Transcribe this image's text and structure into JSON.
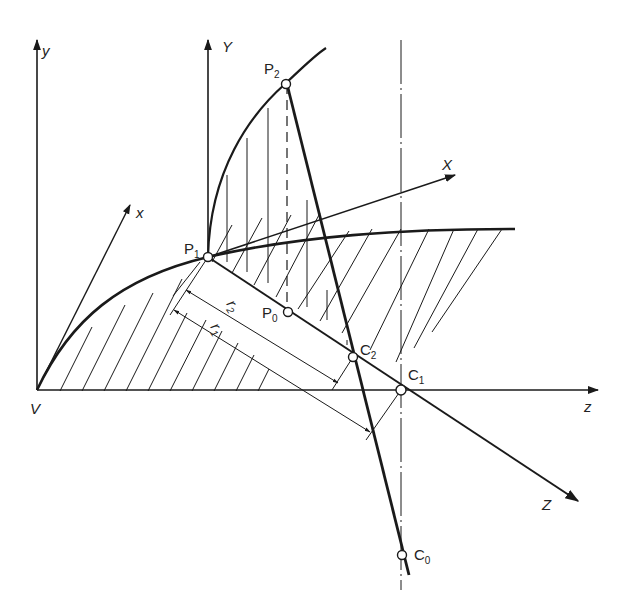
{
  "figure": {
    "type": "geometric construction diagram",
    "axes": {
      "left_y": "y",
      "left_x": "x",
      "origin": "V",
      "right_z": "z",
      "upper_Y": "Y",
      "upper_X": "X",
      "lower_Z": "Z"
    },
    "points": {
      "P1": {
        "base": "P",
        "sub": "1"
      },
      "P2": {
        "base": "P",
        "sub": "2"
      },
      "P0": {
        "base": "P",
        "sub": "0"
      },
      "C0": {
        "base": "C",
        "sub": "0"
      },
      "C1": {
        "base": "C",
        "sub": "1"
      },
      "C2": {
        "base": "C",
        "sub": "2"
      }
    },
    "dimensions": {
      "r1": {
        "base": "r",
        "sub": "1"
      },
      "r2": {
        "base": "r",
        "sub": "2"
      }
    },
    "colors": {
      "ink": "#1a1a1a",
      "background": "#ffffff"
    }
  }
}
